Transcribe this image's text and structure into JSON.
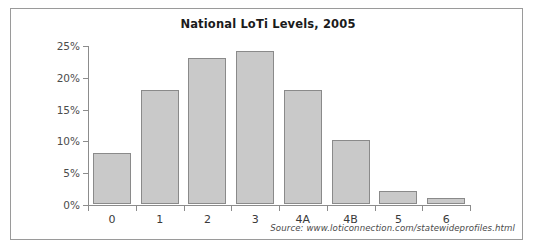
{
  "chart_data": {
    "type": "bar",
    "title": "National LoTi Levels, 2005",
    "xlabel": "",
    "ylabel": "",
    "categories": [
      "0",
      "1",
      "2",
      "3",
      "4A",
      "4B",
      "5",
      "6"
    ],
    "values": [
      8,
      18,
      23,
      24,
      18,
      10,
      2,
      1
    ],
    "value_unit": "%",
    "ylim": [
      0,
      25
    ],
    "ytick_values": [
      0,
      5,
      10,
      15,
      20,
      25
    ],
    "ytick_labels": [
      "0%",
      "5%",
      "10%",
      "15%",
      "20%",
      "25%"
    ],
    "grid": false,
    "legend": false,
    "legend_position": "none",
    "bar_color": "#c9c9c9",
    "bar_border_color": "#8a8a8a",
    "axis_color": "#8c8c8c",
    "series": [
      {
        "name": "National LoTi Levels, 2005",
        "values": [
          8,
          18,
          23,
          24,
          18,
          10,
          2,
          1
        ]
      }
    ]
  },
  "annotations": {
    "source": "Source: www.loticonnection.com/statewideprofiles.html"
  }
}
